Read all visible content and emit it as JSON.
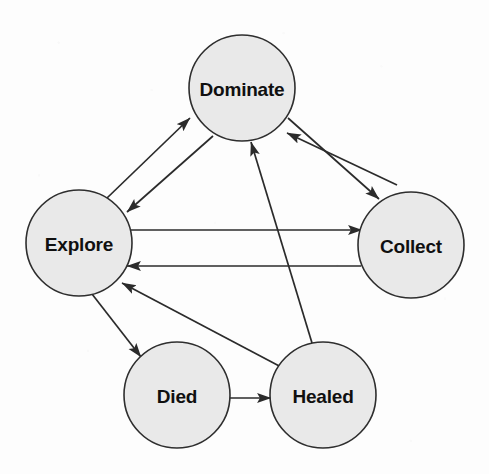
{
  "diagram": {
    "background_color": "#fdfdfd",
    "node_fill_color": "#e9e9e9",
    "node_stroke_color": "#2e2e2e",
    "edge_color": "#2b2b2b",
    "node_radius": 53,
    "nodes": [
      {
        "id": "dominate",
        "label": "Dominate",
        "cx": 242,
        "cy": 88
      },
      {
        "id": "explore",
        "label": "Explore",
        "cx": 79,
        "cy": 243
      },
      {
        "id": "collect",
        "label": "Collect",
        "cx": 411,
        "cy": 245
      },
      {
        "id": "died",
        "label": "Died",
        "cx": 177,
        "cy": 395
      },
      {
        "id": "healed",
        "label": "Healed",
        "cx": 323,
        "cy": 395
      }
    ],
    "edges": [
      {
        "id": "explore-to-dominate",
        "from": "Explore",
        "to": "Dominate",
        "x1": 107,
        "y1": 198,
        "x2": 190,
        "y2": 118,
        "arrow": "end"
      },
      {
        "id": "dominate-to-explore",
        "from": "Dominate",
        "to": "Explore",
        "x1": 213,
        "y1": 136,
        "x2": 127,
        "y2": 212,
        "arrow": "end"
      },
      {
        "id": "dominate-to-collect",
        "from": "Dominate",
        "to": "Collect",
        "x1": 288,
        "y1": 118,
        "x2": 379,
        "y2": 199,
        "arrow": "end"
      },
      {
        "id": "collect-to-dominate",
        "from": "Collect",
        "to": "Dominate",
        "x1": 397,
        "y1": 185,
        "x2": 287,
        "y2": 133,
        "arrow": "end"
      },
      {
        "id": "explore-to-collect",
        "from": "Explore",
        "to": "Collect",
        "x1": 129,
        "y1": 230,
        "x2": 362,
        "y2": 230,
        "arrow": "end"
      },
      {
        "id": "collect-to-explore",
        "from": "Collect",
        "to": "Explore",
        "x1": 361,
        "y1": 266,
        "x2": 127,
        "y2": 266,
        "arrow": "end"
      },
      {
        "id": "healed-to-dominate",
        "from": "Healed",
        "to": "Dominate",
        "x1": 312,
        "y1": 343,
        "x2": 251,
        "y2": 142,
        "arrow": "end"
      },
      {
        "id": "healed-to-explore",
        "from": "Healed",
        "to": "Explore",
        "x1": 283,
        "y1": 368,
        "x2": 122,
        "y2": 283,
        "arrow": "end"
      },
      {
        "id": "explore-to-died",
        "from": "Explore",
        "to": "Died",
        "x1": 92,
        "y1": 294,
        "x2": 141,
        "y2": 357,
        "arrow": "end"
      },
      {
        "id": "died-to-healed",
        "from": "Died",
        "to": "Healed",
        "x1": 230,
        "y1": 398,
        "x2": 271,
        "y2": 398,
        "arrow": "end"
      }
    ]
  }
}
